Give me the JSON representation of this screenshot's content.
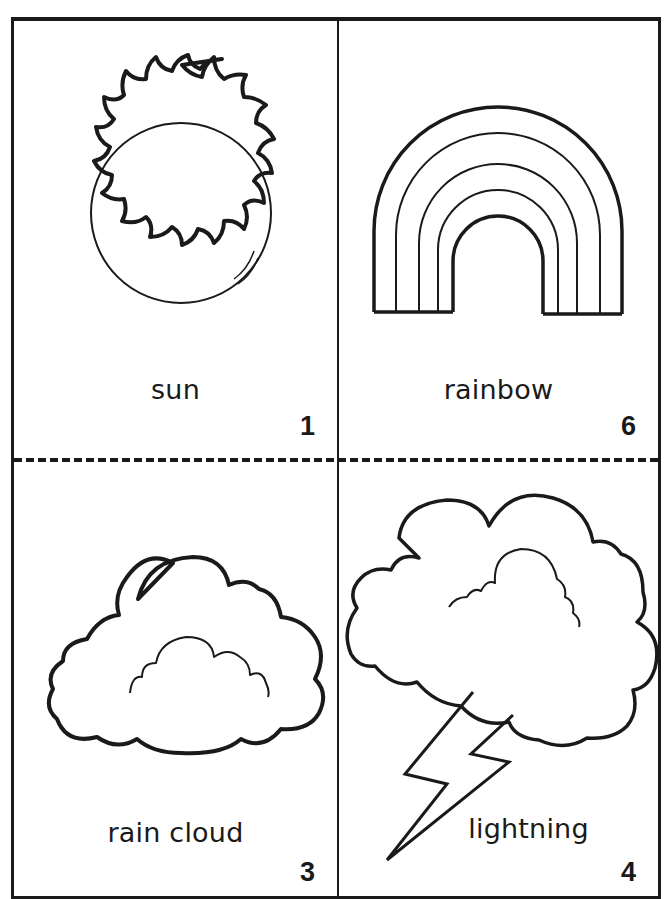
{
  "sheet": {
    "cut_line": "dashed",
    "cards": [
      {
        "position": "top-left",
        "label": "sun",
        "number": "1",
        "picture": "sun-icon"
      },
      {
        "position": "top-right",
        "label": "rainbow",
        "number": "6",
        "picture": "rainbow-icon"
      },
      {
        "position": "bottom-left",
        "label": "rain cloud",
        "number": "3",
        "picture": "cloud-icon"
      },
      {
        "position": "bottom-right",
        "label": "lightning",
        "number": "4",
        "picture": "lightning-icon"
      }
    ]
  },
  "colors": {
    "ink": "#1a1a1a",
    "paper": "#ffffff"
  }
}
